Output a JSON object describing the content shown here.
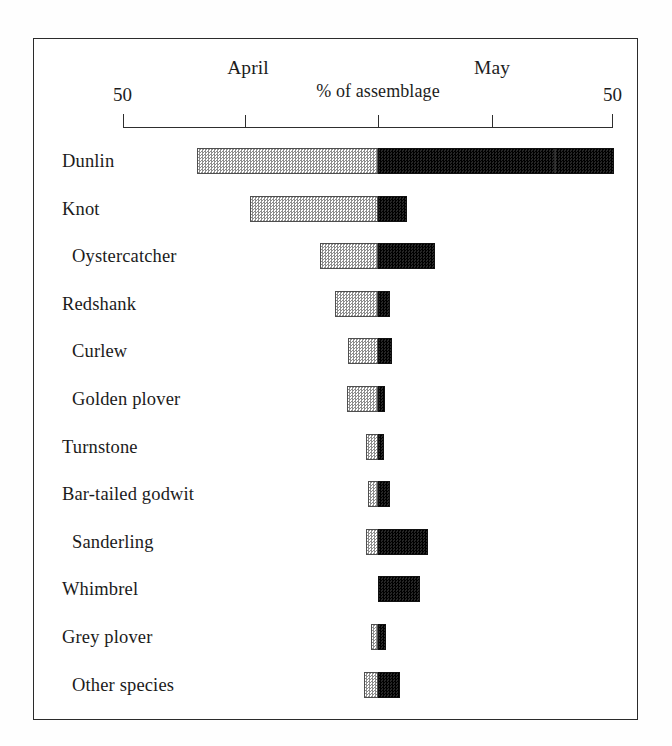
{
  "figure": {
    "frame_visible": true,
    "background_color": "#ffffff",
    "line_color": "#2b2b2b"
  },
  "axis": {
    "center_label": "% of assemblage",
    "left_group_label": "April",
    "right_group_label": "May",
    "left_end_tick_label": "50",
    "right_end_tick_label": "50",
    "tick_labels": [
      "50",
      "",
      "",
      "",
      "50"
    ]
  },
  "chart_data": {
    "type": "bar",
    "orientation": "horizontal",
    "style": "diverging-stacked",
    "title": "",
    "subtitle": "",
    "xlabel": "% of assemblage",
    "ylabel": "",
    "xlim": [
      -50,
      50
    ],
    "grid": false,
    "legend_position": "none",
    "axis_tick_values": [
      -50,
      -25,
      0,
      25,
      50
    ],
    "axis_tick_labels": [
      "50",
      "",
      "",
      "",
      "50"
    ],
    "series": [
      {
        "name": "April",
        "color": "#c9c9c9",
        "pattern": "stipple",
        "side": "left"
      },
      {
        "name": "May",
        "color": "#151515",
        "pattern": "solid",
        "side": "right"
      }
    ],
    "categories": [
      "Dunlin",
      "Knot",
      "Oystercatcher",
      "Redshank",
      "Curlew",
      "Golden plover",
      "Turnstone",
      "Bar-tailed godwit",
      "Sanderling",
      "Whimbrel",
      "Grey plover",
      "Other species"
    ],
    "values": {
      "April": [
        36.9,
        26.2,
        11.9,
        8.8,
        6.1,
        6.3,
        2.5,
        2.0,
        2.5,
        0.0,
        1.4,
        2.9
      ],
      "May": [
        48.2,
        5.9,
        11.7,
        2.5,
        2.9,
        1.4,
        1.2,
        2.5,
        10.2,
        8.6,
        1.6,
        4.5
      ]
    }
  },
  "rows": [
    {
      "label": "Dunlin",
      "april": 36.9,
      "may": 48.2,
      "seam_at": 35.9
    },
    {
      "label": "Knot",
      "april": 26.2,
      "may": 5.9,
      "seam_at": null
    },
    {
      "label": "Oystercatcher",
      "april": 11.9,
      "may": 11.7,
      "seam_at": null
    },
    {
      "label": "Redshank",
      "april": 8.8,
      "may": 2.5,
      "seam_at": null
    },
    {
      "label": "Curlew",
      "april": 6.1,
      "may": 2.9,
      "seam_at": null
    },
    {
      "label": "Golden plover",
      "april": 6.3,
      "may": 1.4,
      "seam_at": null
    },
    {
      "label": "Turnstone",
      "april": 2.5,
      "may": 1.2,
      "seam_at": null
    },
    {
      "label": "Bar-tailed godwit",
      "april": 2.0,
      "may": 2.5,
      "seam_at": null
    },
    {
      "label": "Sanderling",
      "april": 2.5,
      "may": 10.2,
      "seam_at": null
    },
    {
      "label": "Whimbrel",
      "april": 0.0,
      "may": 8.6,
      "seam_at": null
    },
    {
      "label": "Grey plover",
      "april": 1.4,
      "may": 1.6,
      "seam_at": null
    },
    {
      "label": "Other species",
      "april": 2.9,
      "may": 4.5,
      "seam_at": null
    }
  ],
  "layout": {
    "center_x": 378,
    "left_end_x": 123,
    "right_end_x": 613,
    "units_per_percent": 4.9,
    "first_row_top": 146,
    "row_pitch": 47.6,
    "label_left_x": 62,
    "label_indent_x": 72
  }
}
